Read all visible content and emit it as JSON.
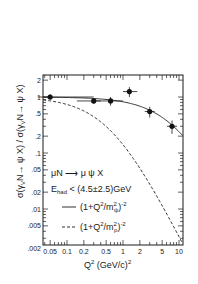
{
  "chart_data": {
    "type": "scatter",
    "title": "",
    "xlabel": "Q² (GeV/c)²",
    "ylabel": "σ(γ_V N → ψ X) / σ(γ_V N → ψ X)",
    "xscale": "log",
    "yscale": "log",
    "xlim": [
      0.03,
      12
    ],
    "ylim": [
      0.0018,
      2.8
    ],
    "grid": false,
    "x_ticks": [
      {
        "value": 0.05,
        "label": "0.05"
      },
      {
        "value": 0.1,
        "label": "0.1"
      },
      {
        "value": 0.2,
        "label": "0.2"
      },
      {
        "value": 0.5,
        "label": "0.5"
      },
      {
        "value": 1,
        "label": "1"
      },
      {
        "value": 2,
        "label": "2"
      },
      {
        "value": 5,
        "label": "5"
      },
      {
        "value": 10,
        "label": "10"
      }
    ],
    "y_ticks": [
      {
        "value": 2,
        "label": "2"
      },
      {
        "value": 1,
        "label": "1"
      },
      {
        "value": 0.5,
        "label": ".5"
      },
      {
        "value": 0.2,
        "label": ".2"
      },
      {
        "value": 0.1,
        "label": ".1"
      },
      {
        "value": 0.05,
        "label": ".05"
      },
      {
        "value": 0.02,
        "label": ".02"
      },
      {
        "value": 0.01,
        "label": ".01"
      },
      {
        "value": 0.005,
        "label": ".005"
      },
      {
        "value": 0.002,
        "label": ".002"
      }
    ],
    "series": [
      {
        "name": "data",
        "kind": "points",
        "x": [
          0.05,
          0.3,
          0.6,
          1.3,
          3.0,
          7.5
        ],
        "y": [
          1.0,
          0.85,
          0.85,
          1.25,
          0.55,
          0.3
        ],
        "x_err_lo": [
          0.02,
          0.15,
          0.3,
          0.3,
          0,
          0
        ],
        "x_err_hi": [
          0.25,
          0.1,
          0.4,
          0.5,
          0,
          0
        ],
        "y_err": [
          0.12,
          0.1,
          0.15,
          0.25,
          0.12,
          0.08
        ]
      },
      {
        "name": "(1+Q²/m_ψ²)⁻²",
        "kind": "line",
        "style": "solid",
        "mass_sq": 9.6
      },
      {
        "name": "(1+Q²/m_ρ²)⁻²",
        "kind": "line",
        "style": "dashed",
        "mass_sq": 0.6
      }
    ],
    "annotations": [
      "μN → μ ψ X",
      "E_had < (4.5±2.5) GeV"
    ],
    "legend_position": "lower-left inside"
  },
  "legend": {
    "process": "μN ⟶ μ ψ X",
    "ehad_prefix": "E",
    "ehad_sub": "had",
    "ehad_rest": " < (4.5±2.5)GeV",
    "solid_label_a": "(1+Q",
    "solid_label_b": "/m",
    "solid_sub": "ψ",
    "solid_tail": ")",
    "dashed_label_a": "(1+Q",
    "dashed_label_b": "/m",
    "dashed_sub": "ρ",
    "dashed_tail": ")",
    "sup2": "2",
    "supm2": "-2"
  },
  "axes": {
    "xlabel_main": "Q",
    "xlabel_sup": "2",
    "xlabel_rest": " (GeV/c)",
    "xlabel_sup2": "2",
    "ylabel_text": "σ(γ",
    "ylabel_sub": "V",
    "ylabel_rest": "N→ ψ X) / σ(γ",
    "ylabel_sub2": "V",
    "ylabel_tail": "N→ ψ X)"
  }
}
